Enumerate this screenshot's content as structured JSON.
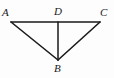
{
  "figure": {
    "type": "geometry-diagram",
    "background_color": "#fdfdfd",
    "line_color": "#1a1a1a",
    "label_color": "#1a1a1a",
    "points": [
      {
        "id": "A",
        "label": "A",
        "x": 11,
        "y": 22
      },
      {
        "id": "D",
        "label": "D",
        "x": 58,
        "y": 22
      },
      {
        "id": "C",
        "label": "C",
        "x": 100,
        "y": 22
      },
      {
        "id": "B",
        "label": "B",
        "x": 58,
        "y": 60
      }
    ],
    "segments": [
      {
        "id": "AC",
        "from": "A",
        "to": "C",
        "x1": 11,
        "y1": 22,
        "x2": 100,
        "y2": 22
      },
      {
        "id": "AB",
        "from": "A",
        "to": "B",
        "x1": 11,
        "y1": 22,
        "x2": 58,
        "y2": 60
      },
      {
        "id": "CB",
        "from": "C",
        "to": "B",
        "x1": 100,
        "y1": 22,
        "x2": 58,
        "y2": 60
      },
      {
        "id": "DB",
        "from": "D",
        "to": "B",
        "x1": 58,
        "y1": 22,
        "x2": 58,
        "y2": 60
      }
    ],
    "labels": {
      "A": "A",
      "B": "B",
      "C": "C",
      "D": "D"
    }
  }
}
